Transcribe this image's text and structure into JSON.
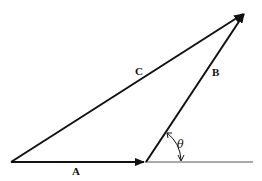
{
  "diagram": {
    "title": "",
    "type": "vector triangle",
    "vectors": [
      {
        "name": "A",
        "label": "A",
        "from": [
          11,
          162
        ],
        "to": [
          145,
          162
        ]
      },
      {
        "name": "B",
        "label": "B",
        "from": [
          145,
          162
        ],
        "to": [
          245,
          13
        ]
      },
      {
        "name": "C",
        "label": "C",
        "from": [
          11,
          162
        ],
        "to": [
          245,
          13
        ]
      }
    ],
    "baseline": {
      "from": [
        145,
        162
      ],
      "to": [
        253,
        162
      ]
    },
    "angle": {
      "label": "θ",
      "vertex": [
        145,
        162
      ],
      "between": [
        "baseline",
        "B"
      ]
    },
    "colors": {
      "stroke": "#111111",
      "baseline": "#555555",
      "background": "#ffffff"
    }
  }
}
